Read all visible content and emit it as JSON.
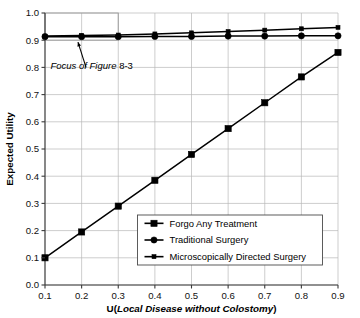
{
  "chart_data": {
    "type": "line",
    "title": "",
    "xlabel_prefix": "U(",
    "xlabel_italic": "Local Disease without Colostomy",
    "xlabel_suffix": ")",
    "ylabel": "Expected Utility",
    "xlim": [
      0.1,
      0.9
    ],
    "ylim": [
      0.0,
      1.0
    ],
    "grid": true,
    "legend_position": "lower-right-inside",
    "x": [
      0.1,
      0.2,
      0.3,
      0.4,
      0.5,
      0.6,
      0.7,
      0.8,
      0.9
    ],
    "xticks": [
      "0.1",
      "0.2",
      "0.3",
      "0.4",
      "0.5",
      "0.6",
      "0.7",
      "0.8",
      "0.9"
    ],
    "yticks": [
      "0.0",
      "0.1",
      "0.2",
      "0.3",
      "0.4",
      "0.5",
      "0.6",
      "0.7",
      "0.8",
      "0.9",
      "1.0"
    ],
    "series": [
      {
        "name": "Forgo Any Treatment",
        "marker": "square",
        "values": [
          0.1,
          0.195,
          0.29,
          0.385,
          0.48,
          0.575,
          0.67,
          0.765,
          0.855
        ]
      },
      {
        "name": "Traditional Surgery",
        "marker": "circle",
        "values": [
          0.913,
          0.913,
          0.913,
          0.914,
          0.914,
          0.915,
          0.915,
          0.916,
          0.916
        ]
      },
      {
        "name": "Microscopically Directed Surgery",
        "marker": "small-square",
        "values": [
          0.915,
          0.917,
          0.919,
          0.923,
          0.927,
          0.932,
          0.937,
          0.942,
          0.947
        ]
      }
    ],
    "annotations": [
      {
        "text_italic": "Focus of Figure",
        "text_roman": "8-3",
        "arrow_from": [
          0.212,
          0.8
        ],
        "arrow_to": [
          0.19,
          0.893
        ],
        "focus_box": {
          "x0": 0.1,
          "x1": 0.3,
          "y0": 0.9,
          "y1": 1.0
        }
      }
    ]
  },
  "colors": {
    "series": "#000000",
    "grid": "#b8b8b8",
    "axis": "#3a3a3a",
    "focus_box": "#9a9a9a",
    "background": "#ffffff"
  }
}
